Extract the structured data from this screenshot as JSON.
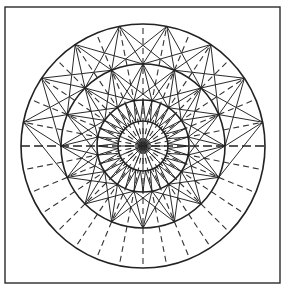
{
  "figure": {
    "title": "",
    "frame": {
      "x": 5,
      "y": 7,
      "width": 275,
      "height": 276
    },
    "center": {
      "x": 143,
      "y": 146
    },
    "circles": [
      {
        "name": "outer",
        "r": 122
      },
      {
        "name": "second",
        "r": 82
      },
      {
        "name": "third",
        "r": 46
      },
      {
        "name": "inner",
        "r": 25
      }
    ],
    "star_points": 16,
    "dashed_radials": 32,
    "outer_star_half": "top",
    "stroke_color": "#222222",
    "background": "#ffffff"
  }
}
